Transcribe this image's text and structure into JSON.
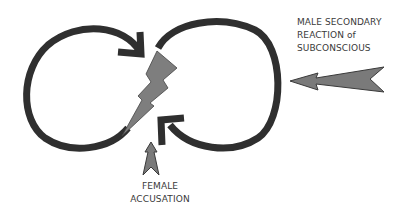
{
  "diagram": {
    "type": "infinity-loop-cycle",
    "colors": {
      "loop_stroke": "#2f2f2f",
      "arrow_fill": "#7a7a7a",
      "arrow_stroke": "#3a3a3a",
      "bolt_fill": "#7e7e7e",
      "text": "#3a3a3a",
      "background": "#ffffff"
    },
    "labels": {
      "male": {
        "lines": [
          "MALE SECONDARY",
          "REACTION of",
          "SUBCONSCIOUS"
        ]
      },
      "female": {
        "lines": [
          "FEMALE",
          "ACCUSATION"
        ]
      }
    },
    "icons": {
      "left_loop": "circular-arrow-clockwise-icon",
      "right_loop": "circular-arrow-counterclockwise-icon",
      "center": "lightning-bolt-icon",
      "male_arrow": "arrow-left-icon",
      "female_arrow": "arrow-up-icon"
    }
  }
}
